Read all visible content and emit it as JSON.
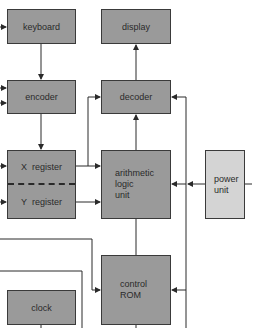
{
  "diagram": {
    "type": "block-diagram",
    "colors": {
      "box_fill": "#9a9a9a",
      "power_fill": "#d4d4d4",
      "line": "#2a2a2a",
      "background": "#ffffff"
    },
    "blocks": {
      "keyboard": {
        "label": "keyboard"
      },
      "display": {
        "label": "display"
      },
      "encoder": {
        "label": "encoder"
      },
      "decoder": {
        "label": "decoder"
      },
      "x_register": {
        "label": "X  register"
      },
      "y_register": {
        "label": "Y  register"
      },
      "alu": {
        "lines": [
          "arithmetic",
          "logic",
          "unit"
        ]
      },
      "power_unit": {
        "lines": [
          "power",
          "unit"
        ]
      },
      "control_rom": {
        "lines": [
          "control",
          "ROM"
        ]
      },
      "clock": {
        "label": "clock"
      }
    },
    "connections": [
      {
        "from": "keyboard",
        "to": "encoder"
      },
      {
        "from": "encoder",
        "to": "x_register"
      },
      {
        "from": "decoder",
        "to": "display"
      },
      {
        "from": "x_register",
        "to": "alu"
      },
      {
        "from": "x_register",
        "to": "decoder"
      },
      {
        "from": "y_register",
        "to": "alu"
      },
      {
        "from": "alu",
        "to": "decoder"
      },
      {
        "from": "power_unit",
        "to": "alu"
      },
      {
        "from": "control_rom",
        "to": "alu"
      },
      {
        "from": "control_rom",
        "to": "decoder"
      },
      {
        "from": "clock",
        "to": "control_rom"
      }
    ]
  }
}
